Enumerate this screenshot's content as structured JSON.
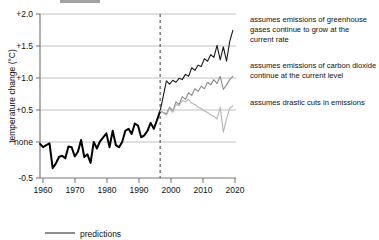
{
  "figure": {
    "background_color": "#ffffff",
    "title_partial": ""
  },
  "axes": {
    "y_label": "temperature change (°C)",
    "y_ticks": [
      "+2.0",
      "+1.5",
      "+1.0",
      "+0.5",
      "none",
      "-0.5"
    ],
    "x_ticks": [
      "1960",
      "1970",
      "1980",
      "1990",
      "2000",
      "2010",
      "2020"
    ]
  },
  "legend": {
    "items": [
      {
        "label": "predictions",
        "color": "#7a7a7a"
      }
    ]
  },
  "annotations": [
    {
      "name": "high-emissions-scenario",
      "lines": [
        "assumes emissions of greenhouse",
        "gases continue to grow at the",
        "current rate"
      ],
      "color": "#1a1a1a"
    },
    {
      "name": "constant-emissions-scenario",
      "lines": [
        "assumes emissions of  carbon dioxide",
        "continue at the current level"
      ],
      "color": "#1a1a1a"
    },
    {
      "name": "drastic-cuts-scenario",
      "lines": [
        "assumes drastic cuts in emissions"
      ],
      "color": "#1a1a1a"
    }
  ],
  "divider": {
    "name": "forecast-start-divider",
    "year": 1998,
    "style": "dashed",
    "color": "#4d4d4d"
  },
  "chart_data": {
    "type": "line",
    "title": "",
    "xlabel": "",
    "ylabel": "temperature change (°C)",
    "xlim": [
      1960,
      2022
    ],
    "ylim": [
      -0.5,
      2.0
    ],
    "grid": true,
    "legend_position": "bottom-left",
    "x_ticks": [
      1960,
      1970,
      1980,
      1990,
      2000,
      2010,
      2020
    ],
    "y_ticks": [
      -0.5,
      0.0,
      0.5,
      1.0,
      1.5,
      2.0
    ],
    "y_tick_labels": [
      "-0.5",
      "none",
      "+0.5",
      "+1.0",
      "+1.5",
      "+2.0"
    ],
    "forecast_start": 1998,
    "series": [
      {
        "name": "observed record",
        "color": "#000000",
        "width": 2.0,
        "x": [
          1960,
          1961,
          1962,
          1963,
          1964,
          1965,
          1966,
          1967,
          1968,
          1969,
          1970,
          1971,
          1972,
          1973,
          1974,
          1975,
          1976,
          1977,
          1978,
          1979,
          1980,
          1981,
          1982,
          1983,
          1984,
          1985,
          1986,
          1987,
          1988,
          1989,
          1990,
          1991,
          1992,
          1993,
          1994,
          1995,
          1996,
          1997,
          1998
        ],
        "y": [
          0.02,
          -0.03,
          0.0,
          0.03,
          -0.35,
          -0.28,
          -0.18,
          -0.16,
          -0.2,
          -0.02,
          -0.03,
          -0.17,
          -0.1,
          0.08,
          -0.18,
          -0.14,
          -0.27,
          0.05,
          -0.05,
          0.06,
          0.12,
          0.18,
          -0.03,
          0.22,
          0.0,
          -0.03,
          0.05,
          0.22,
          0.25,
          0.17,
          0.33,
          0.3,
          0.12,
          0.15,
          0.22,
          0.34,
          0.25,
          0.38,
          0.52
        ]
      },
      {
        "name": "high emissions prediction",
        "color": "#1a1a1a",
        "width": 1.1,
        "x": [
          1998,
          2000,
          2001,
          2002,
          2003,
          2004,
          2005,
          2006,
          2007,
          2008,
          2009,
          2010,
          2011,
          2012,
          2013,
          2014,
          2015,
          2016,
          2017,
          2018,
          2019,
          2020,
          2021
        ],
        "y": [
          0.52,
          0.98,
          0.93,
          0.99,
          0.96,
          1.02,
          1.0,
          1.08,
          1.05,
          1.18,
          1.14,
          1.22,
          1.2,
          1.32,
          1.28,
          1.38,
          1.34,
          1.52,
          1.3,
          1.5,
          1.28,
          1.58,
          1.75
        ]
      },
      {
        "name": "constant emissions prediction",
        "color": "#8c8c8c",
        "width": 1.1,
        "x": [
          1998,
          2000,
          2001,
          2002,
          2003,
          2004,
          2005,
          2006,
          2007,
          2008,
          2009,
          2010,
          2011,
          2012,
          2013,
          2014,
          2015,
          2016,
          2017,
          2018,
          2019,
          2020,
          2021
        ],
        "y": [
          0.52,
          0.48,
          0.58,
          0.52,
          0.66,
          0.62,
          0.74,
          0.7,
          0.8,
          0.76,
          0.86,
          0.82,
          0.9,
          0.86,
          0.96,
          0.92,
          1.0,
          0.94,
          1.05,
          0.85,
          0.92,
          1.0,
          1.05
        ]
      },
      {
        "name": "drastic cuts prediction",
        "color": "#b5b5b5",
        "width": 1.1,
        "x": [
          1998,
          2000,
          2001,
          2002,
          2003,
          2004,
          2005,
          2006,
          2007,
          2008,
          2009,
          2010,
          2011,
          2012,
          2013,
          2014,
          2015,
          2016,
          2017,
          2018,
          2019,
          2020,
          2021
        ],
        "y": [
          0.52,
          0.46,
          0.56,
          0.5,
          0.62,
          0.6,
          0.68,
          0.66,
          0.7,
          0.64,
          0.62,
          0.58,
          0.56,
          0.52,
          0.5,
          0.46,
          0.44,
          0.4,
          0.58,
          0.2,
          0.4,
          0.56,
          0.6
        ]
      }
    ]
  }
}
